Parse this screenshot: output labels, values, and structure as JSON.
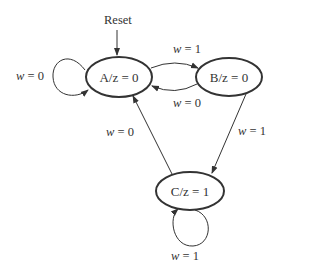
{
  "diagram": {
    "type": "state-machine",
    "reset_label": "Reset",
    "states": [
      {
        "id": "A",
        "label": "A/z = 0"
      },
      {
        "id": "B",
        "label": "B/z = 0"
      },
      {
        "id": "C",
        "label": "C/z = 1"
      }
    ],
    "transitions": [
      {
        "from": "A",
        "to": "A",
        "var": "w",
        "label": "= 0"
      },
      {
        "from": "A",
        "to": "B",
        "var": "w",
        "label": "= 1"
      },
      {
        "from": "B",
        "to": "A",
        "var": "w",
        "label": "= 0"
      },
      {
        "from": "B",
        "to": "C",
        "var": "w",
        "label": "= 1"
      },
      {
        "from": "C",
        "to": "A",
        "var": "w",
        "label": "= 0"
      },
      {
        "from": "C",
        "to": "C",
        "var": "w",
        "label": "= 1"
      }
    ]
  }
}
